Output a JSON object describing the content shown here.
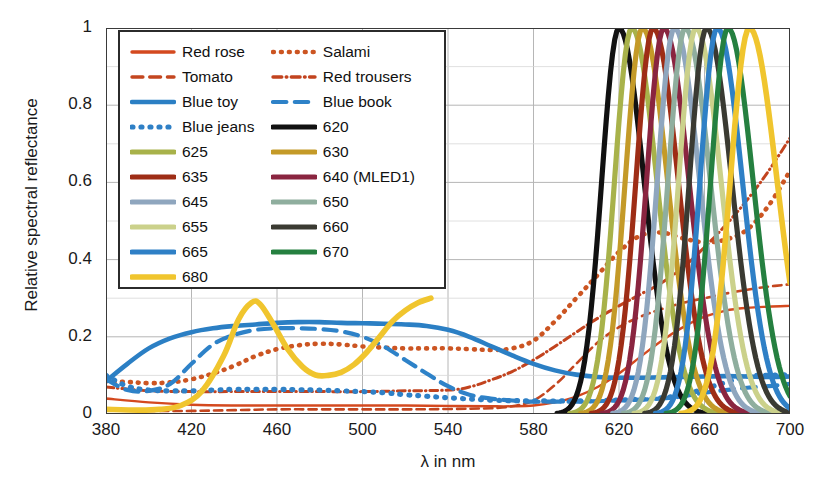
{
  "axes": {
    "ylabel": "Relative spectral reflectance",
    "xlabel": "λ in nm",
    "yticks": [
      "0",
      "0.2",
      "0.4",
      "0.6",
      "0.8",
      "1"
    ],
    "xticks": [
      "380",
      "420",
      "460",
      "500",
      "540",
      "580",
      "620",
      "660",
      "700"
    ]
  },
  "legend": {
    "rows": [
      [
        {
          "label": "Red rose",
          "key": "red_rose"
        },
        {
          "label": "Salami",
          "key": "salami"
        }
      ],
      [
        {
          "label": "Tomato",
          "key": "tomato"
        },
        {
          "label": "Red trousers",
          "key": "red_trousers"
        }
      ],
      [
        {
          "label": "Blue toy",
          "key": "blue_toy"
        },
        {
          "label": "Blue book",
          "key": "blue_book"
        }
      ],
      [
        {
          "label": "Blue jeans",
          "key": "blue_jeans"
        },
        {
          "label": "620",
          "key": "led620"
        }
      ],
      [
        {
          "label": "625",
          "key": "led625"
        },
        {
          "label": "630",
          "key": "led630"
        }
      ],
      [
        {
          "label": "635",
          "key": "led635"
        },
        {
          "label": "640 (MLED1)",
          "key": "led640"
        }
      ],
      [
        {
          "label": "645",
          "key": "led645"
        },
        {
          "label": "650",
          "key": "led650"
        }
      ],
      [
        {
          "label": "655",
          "key": "led655"
        },
        {
          "label": "660",
          "key": "led660"
        }
      ],
      [
        {
          "label": "665",
          "key": "led665"
        },
        {
          "label": "670",
          "key": "led670"
        }
      ],
      [
        {
          "label": "680",
          "key": "led680"
        },
        null
      ]
    ]
  },
  "chart_data": {
    "type": "line",
    "title": "",
    "xlabel": "λ in nm",
    "ylabel": "Relative spectral reflectance",
    "xlim": [
      380,
      700
    ],
    "ylim": [
      0,
      1
    ],
    "grid": true,
    "legend_position": "upper-left-inside",
    "xticks": [
      380,
      420,
      460,
      500,
      540,
      580,
      620,
      660,
      700
    ],
    "yticks": [
      0,
      0.2,
      0.4,
      0.6,
      0.8,
      1.0
    ],
    "series": [
      {
        "name": "Red rose",
        "key": "red_rose",
        "color": "#d4491f",
        "style": "solid",
        "width": 2.4,
        "x": [
          380,
          400,
          420,
          440,
          460,
          480,
          500,
          520,
          540,
          560,
          570,
          580,
          590,
          600,
          610,
          620,
          630,
          640,
          650,
          660,
          670,
          680,
          690,
          700
        ],
        "y": [
          0.04,
          0.03,
          0.024,
          0.022,
          0.022,
          0.022,
          0.022,
          0.022,
          0.021,
          0.02,
          0.02,
          0.022,
          0.03,
          0.045,
          0.07,
          0.105,
          0.148,
          0.19,
          0.225,
          0.252,
          0.268,
          0.275,
          0.278,
          0.28
        ]
      },
      {
        "name": "Tomato",
        "key": "tomato",
        "color": "#c4461f",
        "style": "dashed",
        "width": 2.6,
        "x": [
          380,
          400,
          420,
          440,
          460,
          480,
          500,
          520,
          540,
          560,
          570,
          580,
          590,
          600,
          610,
          620,
          630,
          640,
          650,
          660,
          670,
          680,
          690,
          700
        ],
        "y": [
          0.01,
          0.008,
          0.008,
          0.01,
          0.012,
          0.012,
          0.012,
          0.012,
          0.013,
          0.015,
          0.02,
          0.035,
          0.075,
          0.13,
          0.185,
          0.225,
          0.252,
          0.272,
          0.288,
          0.3,
          0.312,
          0.322,
          0.33,
          0.336
        ]
      },
      {
        "name": "Salami",
        "key": "salami",
        "color": "#cc5522",
        "style": "dotted",
        "width": 4.6,
        "x": [
          380,
          390,
          400,
          410,
          420,
          430,
          440,
          450,
          460,
          470,
          480,
          490,
          500,
          510,
          520,
          530,
          540,
          550,
          560,
          570,
          580,
          590,
          600,
          610,
          620,
          630,
          640,
          650,
          660,
          670,
          680,
          690,
          700
        ],
        "y": [
          0.085,
          0.083,
          0.08,
          0.082,
          0.09,
          0.105,
          0.125,
          0.15,
          0.168,
          0.178,
          0.182,
          0.18,
          0.175,
          0.172,
          0.17,
          0.17,
          0.17,
          0.168,
          0.166,
          0.17,
          0.19,
          0.24,
          0.3,
          0.36,
          0.42,
          0.462,
          0.47,
          0.455,
          0.445,
          0.452,
          0.478,
          0.54,
          0.63
        ]
      },
      {
        "name": "Red trousers",
        "key": "red_trousers",
        "color": "#c2431e",
        "style": "dashdot",
        "width": 3.0,
        "x": [
          380,
          400,
          420,
          440,
          460,
          480,
          500,
          520,
          540,
          550,
          560,
          570,
          580,
          590,
          600,
          610,
          620,
          630,
          640,
          650,
          660,
          670,
          680,
          690,
          700
        ],
        "y": [
          0.07,
          0.06,
          0.058,
          0.058,
          0.058,
          0.058,
          0.058,
          0.06,
          0.062,
          0.07,
          0.088,
          0.11,
          0.14,
          0.175,
          0.212,
          0.248,
          0.28,
          0.31,
          0.34,
          0.38,
          0.432,
          0.49,
          0.555,
          0.63,
          0.715
        ]
      },
      {
        "name": "Blue toy",
        "key": "blue_toy",
        "color": "#2b7fc4",
        "style": "solid",
        "width": 4.6,
        "x": [
          380,
          390,
          400,
          410,
          420,
          430,
          440,
          450,
          460,
          470,
          480,
          490,
          500,
          510,
          520,
          530,
          540,
          550,
          560,
          570,
          580,
          590,
          600,
          610,
          620,
          630,
          640,
          650,
          660,
          670,
          680,
          690,
          700
        ],
        "y": [
          0.085,
          0.13,
          0.17,
          0.196,
          0.212,
          0.222,
          0.228,
          0.232,
          0.236,
          0.238,
          0.238,
          0.236,
          0.235,
          0.234,
          0.232,
          0.228,
          0.218,
          0.2,
          0.176,
          0.152,
          0.13,
          0.113,
          0.102,
          0.096,
          0.094,
          0.094,
          0.095,
          0.096,
          0.097,
          0.098,
          0.097,
          0.096,
          0.097
        ]
      },
      {
        "name": "Blue book",
        "key": "blue_book",
        "color": "#2e82c8",
        "style": "dashed",
        "width": 4.2,
        "x": [
          380,
          390,
          400,
          410,
          420,
          430,
          440,
          450,
          460,
          470,
          480,
          490,
          500,
          510,
          520,
          530,
          540,
          550,
          560,
          570,
          580,
          590,
          600,
          620,
          640,
          650,
          660,
          670,
          680,
          690,
          700
        ],
        "y": [
          0.09,
          0.062,
          0.06,
          0.078,
          0.13,
          0.18,
          0.205,
          0.218,
          0.222,
          0.222,
          0.22,
          0.214,
          0.2,
          0.175,
          0.14,
          0.105,
          0.072,
          0.05,
          0.04,
          0.035,
          0.032,
          0.032,
          0.032,
          0.035,
          0.04,
          0.046,
          0.055,
          0.062,
          0.068,
          0.072,
          0.078
        ]
      },
      {
        "name": "Blue jeans",
        "key": "blue_jeans",
        "color": "#2f80c6",
        "style": "dotted",
        "width": 5.2,
        "x": [
          380,
          390,
          400,
          410,
          420,
          430,
          440,
          450,
          460,
          470,
          480,
          490,
          500,
          510,
          520,
          530,
          540,
          560,
          580,
          600,
          620,
          640,
          650,
          660,
          670,
          680,
          690,
          700
        ],
        "y": [
          0.1,
          0.072,
          0.062,
          0.06,
          0.06,
          0.062,
          0.064,
          0.064,
          0.064,
          0.063,
          0.062,
          0.06,
          0.058,
          0.055,
          0.05,
          0.046,
          0.042,
          0.036,
          0.034,
          0.034,
          0.036,
          0.042,
          0.05,
          0.065,
          0.082,
          0.098,
          0.1,
          0.102
        ]
      },
      {
        "name": "620",
        "key": "led620",
        "color": "#111111",
        "style": "solid",
        "width": 5.2,
        "peak": 620,
        "fwhm": 19,
        "rise_nm": 592,
        "label_note": "LED 620 nm"
      },
      {
        "name": "625",
        "key": "led625",
        "color": "#a8b24a",
        "style": "solid",
        "width": 5.2,
        "peak": 626,
        "fwhm": 19
      },
      {
        "name": "630",
        "key": "led630",
        "color": "#c49a28",
        "style": "solid",
        "width": 5.2,
        "peak": 631,
        "fwhm": 19
      },
      {
        "name": "635",
        "key": "led635",
        "color": "#9e2d16",
        "style": "solid",
        "width": 5.2,
        "peak": 636,
        "fwhm": 19
      },
      {
        "name": "640 (MLED1)",
        "key": "led640",
        "color": "#8a2540",
        "style": "solid",
        "width": 5.2,
        "peak": 641,
        "fwhm": 19
      },
      {
        "name": "645",
        "key": "led645",
        "color": "#8fa6be",
        "style": "solid",
        "width": 5.2,
        "peak": 646,
        "fwhm": 19
      },
      {
        "name": "650",
        "key": "led650",
        "color": "#8fae9e",
        "style": "solid",
        "width": 5.2,
        "peak": 651,
        "fwhm": 19
      },
      {
        "name": "655",
        "key": "led655",
        "color": "#cbd18b",
        "style": "solid",
        "width": 5.2,
        "peak": 656,
        "fwhm": 19
      },
      {
        "name": "660",
        "key": "led660",
        "color": "#3a3a32",
        "style": "solid",
        "width": 5.2,
        "peak": 661,
        "fwhm": 19
      },
      {
        "name": "665",
        "key": "led665",
        "color": "#2f80c6",
        "style": "solid",
        "width": 5.2,
        "peak": 666,
        "fwhm": 19
      },
      {
        "name": "670",
        "key": "led670",
        "color": "#258040",
        "style": "solid",
        "width": 5.2,
        "peak": 671,
        "fwhm": 19
      },
      {
        "name": "680",
        "key": "led680",
        "color": "#f0c52e",
        "style": "solid",
        "width": 5.6,
        "peak": 681,
        "fwhm": 21,
        "secondary_x": [
          380,
          395,
          405,
          415,
          425,
          435,
          442,
          448,
          452,
          458,
          465,
          472,
          478,
          484,
          490,
          496,
          502,
          508,
          514,
          520,
          526,
          532
        ],
        "secondary_y": [
          0.012,
          0.01,
          0.012,
          0.022,
          0.06,
          0.15,
          0.245,
          0.288,
          0.285,
          0.235,
          0.168,
          0.122,
          0.101,
          0.1,
          0.108,
          0.128,
          0.16,
          0.2,
          0.24,
          0.268,
          0.288,
          0.3
        ]
      }
    ]
  }
}
